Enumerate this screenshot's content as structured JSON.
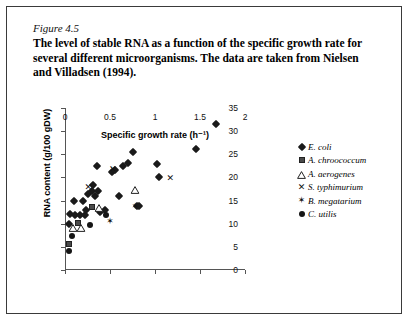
{
  "figure": {
    "number": "Figure 4.5",
    "caption": "The level of stable RNA as a function of the specific growth rate for several different microorganisms. The data are taken from Nielsen and Villadsen (1994)."
  },
  "chart_data": {
    "type": "scatter",
    "title": "",
    "xlabel": "Specific growth rate (h⁻¹)",
    "ylabel": "RNA content (g/100 gDW)",
    "xlim": [
      0,
      2
    ],
    "ylim": [
      0,
      35
    ],
    "xticks": [
      "0",
      "0.5",
      "1",
      "1.5",
      "2"
    ],
    "xtick_values": [
      0,
      0.5,
      1,
      1.5,
      2
    ],
    "yticks": [
      "0",
      "5",
      "10",
      "15",
      "20",
      "25",
      "30",
      "35"
    ],
    "ytick_values": [
      0,
      5,
      10,
      15,
      20,
      25,
      30,
      35
    ],
    "grid": false,
    "legend_position": "right",
    "series": [
      {
        "name": "E. coli",
        "marker": "filled-diamond",
        "color": "#1a1a1a",
        "points": [
          [
            0.04,
            10.0
          ],
          [
            0.06,
            12.0
          ],
          [
            0.1,
            15.0
          ],
          [
            0.11,
            11.9
          ],
          [
            0.17,
            11.9
          ],
          [
            0.2,
            15.0
          ],
          [
            0.22,
            11.9
          ],
          [
            0.23,
            13.0
          ],
          [
            0.25,
            16.4
          ],
          [
            0.3,
            17.1
          ],
          [
            0.31,
            18.4
          ],
          [
            0.33,
            15.9
          ],
          [
            0.35,
            22.4
          ],
          [
            0.37,
            17.1
          ],
          [
            0.39,
            12.6
          ],
          [
            0.44,
            12.9
          ],
          [
            0.52,
            21.2
          ],
          [
            0.55,
            21.6
          ],
          [
            0.6,
            16.0
          ],
          [
            0.64,
            22.5
          ],
          [
            0.7,
            23.2
          ],
          [
            0.75,
            25.5
          ],
          [
            0.8,
            13.8
          ],
          [
            0.82,
            13.8
          ],
          [
            1.02,
            22.9
          ],
          [
            1.04,
            20.2
          ],
          [
            1.45,
            26.1
          ],
          [
            1.68,
            31.5
          ]
        ]
      },
      {
        "name": "A. chroococcum",
        "marker": "filled-square",
        "color": "#4a4a4a",
        "points": [
          [
            0.04,
            5.6
          ],
          [
            0.14,
            10.1
          ],
          [
            0.3,
            13.6
          ]
        ]
      },
      {
        "name": "A. aerogenes",
        "marker": "open-triangle",
        "color": "#222222",
        "points": [
          [
            0.09,
            9.3
          ],
          [
            0.18,
            9.3
          ],
          [
            0.38,
            13.6
          ],
          [
            0.78,
            17.4
          ]
        ]
      },
      {
        "name": "S. typhimurium",
        "marker": "x-cross",
        "color": "#111111",
        "points": [
          [
            0.26,
            18.0
          ],
          [
            0.53,
            21.9
          ],
          [
            1.17,
            19.9
          ]
        ]
      },
      {
        "name": "B. megatarium",
        "marker": "bowtie",
        "color": "#111111",
        "points": [
          [
            0.5,
            10.6
          ],
          [
            0.78,
            13.8
          ]
        ]
      },
      {
        "name": "C. utilis",
        "marker": "filled-circle",
        "color": "#151515",
        "points": [
          [
            0.04,
            4.0
          ],
          [
            0.08,
            7.3
          ],
          [
            0.28,
            9.7
          ],
          [
            0.46,
            11.9
          ]
        ]
      }
    ]
  },
  "legend": {
    "items": [
      {
        "label": "E. coli",
        "glyph": "◆"
      },
      {
        "label": "A. chroococcum",
        "glyph": "■"
      },
      {
        "label": "A. aerogenes",
        "glyph": "△"
      },
      {
        "label": "S. typhimurium",
        "glyph": "✕"
      },
      {
        "label": "B. megatarium",
        "glyph": "✶"
      },
      {
        "label": "C. utilis",
        "glyph": "●"
      }
    ]
  }
}
